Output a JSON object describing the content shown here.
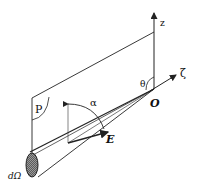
{
  "diagram": {
    "labels": {
      "z_axis": "z",
      "zeta_axis": "ζ",
      "origin": "O",
      "theta": "θ",
      "alpha": "α",
      "plane": "P",
      "field": "E",
      "solid_angle": "dΩ"
    },
    "colors": {
      "line": "#222222",
      "background": "#ffffff",
      "hatch": "#555555"
    }
  }
}
